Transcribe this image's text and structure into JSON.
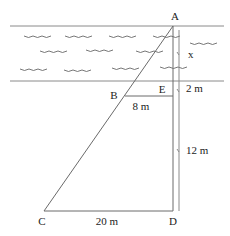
{
  "diagram": {
    "type": "river-width-similar-triangles",
    "points": {
      "A": {
        "label": "A",
        "x": 173,
        "y": 26,
        "lx": 175,
        "ly": 20
      },
      "B": {
        "label": "B",
        "x": 125,
        "y": 96,
        "lx": 114,
        "ly": 99
      },
      "E": {
        "label": "E",
        "x": 173,
        "y": 96,
        "lx": 162,
        "ly": 93
      },
      "C": {
        "label": "C",
        "x": 44,
        "y": 211,
        "lx": 42,
        "ly": 225
      },
      "D": {
        "label": "D",
        "x": 173,
        "y": 211,
        "lx": 173,
        "ly": 225
      }
    },
    "measurements": {
      "x": {
        "label": "x",
        "lx": 188,
        "ly": 58
      },
      "ae_lower": {
        "label": "2 m",
        "lx": 186,
        "ly": 92
      },
      "ed": {
        "label": "12 m",
        "lx": 186,
        "ly": 154
      },
      "be": {
        "label": "8 m",
        "lx": 141,
        "ly": 110
      },
      "cd": {
        "label": "20 m",
        "lx": 107,
        "ly": 225
      }
    },
    "river": {
      "top_bank_y": 26,
      "bottom_bank_y": 81,
      "bank_x_start": 10,
      "bank_x_end": 224,
      "waves": [
        {
          "x": 24,
          "y": 36
        },
        {
          "x": 65,
          "y": 36
        },
        {
          "x": 109,
          "y": 36
        },
        {
          "x": 153,
          "y": 36
        },
        {
          "x": 190,
          "y": 43
        },
        {
          "x": 40,
          "y": 51
        },
        {
          "x": 86,
          "y": 50
        },
        {
          "x": 136,
          "y": 51
        },
        {
          "x": 20,
          "y": 69
        },
        {
          "x": 64,
          "y": 70
        },
        {
          "x": 112,
          "y": 68
        },
        {
          "x": 160,
          "y": 67
        }
      ]
    }
  }
}
